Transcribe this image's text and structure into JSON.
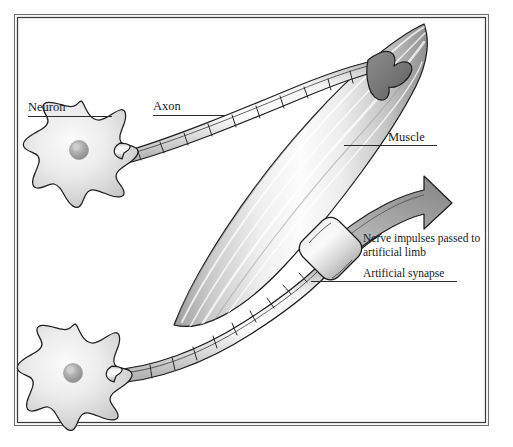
{
  "figure": {
    "background_color": "#ffffff",
    "frame_color": "#3a3a3a",
    "ink_color": "#1f1f1f",
    "structure_fill_light": "#f2f2f2",
    "structure_fill_mid": "#bdbdbd",
    "structure_fill_dark": "#707070"
  },
  "labels": {
    "neuron": "Neuron",
    "axon": "Axon",
    "muscle": "Muscle",
    "impulse_line1": "Nerve impulses passed to",
    "impulse_line2": "artificial limb",
    "artificial_synapse": "Artificial synapse"
  },
  "parts": {
    "neuron_upper": "neuron-cell-body-upper",
    "neuron_lower": "neuron-cell-body-lower",
    "nucleus_upper": "nucleus-upper",
    "nucleus_lower": "nucleus-lower",
    "axon_upper": "myelinated-axon-upper",
    "axon_lower": "myelinated-axon-lower",
    "muscle_body": "muscle-spindle",
    "motor_end_plate": "motor-end-plate",
    "synapse_block": "artificial-synapse-block",
    "impulse_arrow": "impulse-direction-arrow"
  }
}
